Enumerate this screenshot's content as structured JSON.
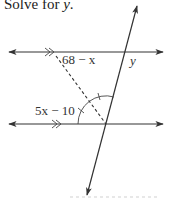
{
  "problem": {
    "prefix": "Solve for ",
    "variable": "y",
    "suffix": "."
  },
  "diagram": {
    "labels": {
      "upper_angle": "68 − x",
      "lower_angle": "5x − 10",
      "unknown": "y"
    },
    "parallel_marks": "double-chevron",
    "colors": {
      "line": "#333333",
      "background": "#ffffff"
    },
    "elements": [
      "upper parallel line with arrows",
      "lower parallel line with arrows",
      "transversal with arrows",
      "dashed angle bisector from lower intersection",
      "arc with two congruence ticks"
    ]
  }
}
